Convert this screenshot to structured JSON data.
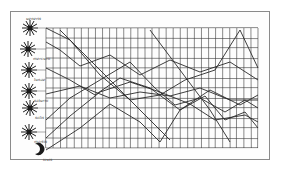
{
  "diagram": {
    "colors": {
      "ink": "#2a2a2a",
      "grid": "#3a3a3a",
      "frame": "#8a8a8a",
      "paper": "#fdfdfd"
    },
    "grid": {
      "x0": 46,
      "y0": 28,
      "x1": 258,
      "y1": 148,
      "cols": 30,
      "rows": 12
    },
    "symbols": [
      {
        "name": "star-symbol-1",
        "x": 30,
        "y": 28,
        "label": "ueneris"
      },
      {
        "name": "star-symbol-2",
        "x": 28,
        "y": 49,
        "label": "mercurii"
      },
      {
        "name": "star-symbol-3",
        "x": 29,
        "y": 70,
        "label": "lunae"
      },
      {
        "name": "star-symbol-4",
        "x": 29,
        "y": 91,
        "label": "saturni"
      },
      {
        "name": "star-symbol-5",
        "x": 30,
        "y": 108,
        "label": "solis"
      },
      {
        "name": "star-symbol-6",
        "x": 29,
        "y": 132,
        "label": "martis"
      },
      {
        "name": "crescent-moon-symbol",
        "x": 38,
        "y": 150,
        "label": "iovis"
      }
    ],
    "header_text": "ueneris",
    "side_labels": [
      "ueneris",
      "mercurii",
      "lunae",
      "saturni",
      "solis",
      "martis",
      "iovis"
    ],
    "curves": [
      {
        "name": "curve-venus",
        "points": "46,28 70,40 100,75 130,100 160,95 185,80 215,70 240,30 258,68"
      },
      {
        "name": "curve-mercury",
        "points": "46,42 60,50 80,66 110,55 140,75 170,60 200,72 230,62 258,80"
      },
      {
        "name": "curve-moon",
        "points": "46,68 70,80 95,95 120,78 150,88 180,110 210,90 240,105 258,95"
      },
      {
        "name": "curve-saturn",
        "points": "46,94 80,86 110,98 140,92 170,96 200,88 230,100 258,100"
      },
      {
        "name": "curve-sun",
        "points": "46,120 70,98 100,80 130,62 155,88 175,105 200,98 225,112 245,100 258,108"
      },
      {
        "name": "curve-mars",
        "points": "46,138 70,116 100,92 130,82 160,92 190,104 215,120 245,115 258,122"
      },
      {
        "name": "curve-jupiter",
        "points": "46,150 80,128 110,104 140,122 160,142 180,110 205,96 225,120 245,112 258,128"
      },
      {
        "name": "curve-diagonal-1",
        "points": "60,30 100,70 140,110 170,140"
      },
      {
        "name": "curve-diagonal-2",
        "points": "150,30 180,70 210,110 230,142"
      }
    ]
  }
}
